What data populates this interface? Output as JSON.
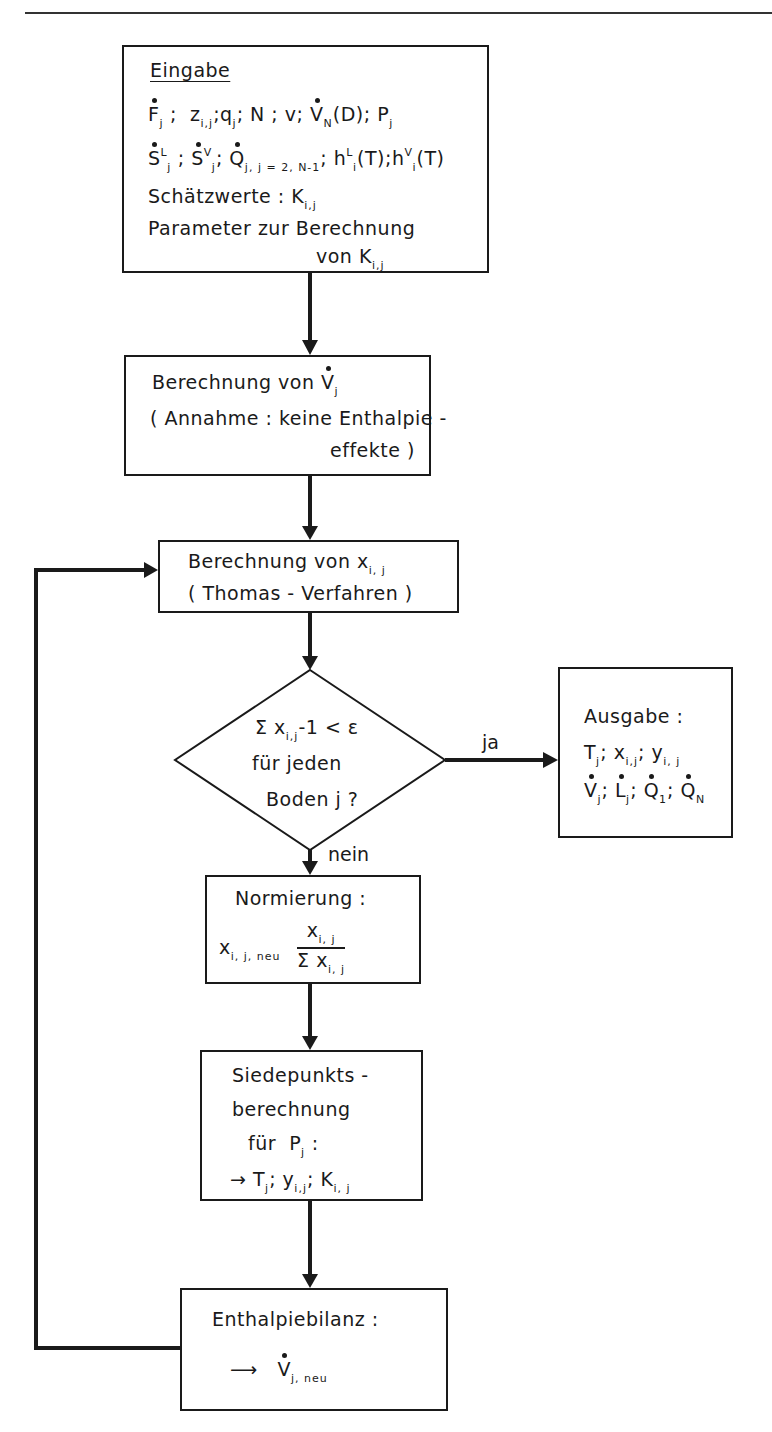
{
  "page": {
    "header_rule": true,
    "header_text": "4.5  Lösungsmethoden"
  },
  "input_box": {
    "title": "Eingabe",
    "line1": {
      "F": "F",
      "F_sub": "j",
      "z": "z",
      "z_sub": "i,j",
      "q": "q",
      "q_sub": "j",
      "N": "N",
      "v": "v",
      "V": "V",
      "V_sub": "N",
      "D": "(D)",
      "P": "P",
      "P_sub": "j"
    },
    "line2": {
      "SL": "S",
      "SL_sup": "L",
      "SL_sub": "j",
      "SV": "S",
      "SV_sup": "V",
      "SV_sub": "j",
      "Q": "Q",
      "Q_sub": "j, j = 2, N-1",
      "hL": "h",
      "hL_sup": "L",
      "hL_sub": "i",
      "hL_arg": "(T)",
      "hV": "h",
      "hV_sup": "V",
      "hV_sub": "i",
      "hV_arg": "(T)"
    },
    "line3_label": "Schätzwerte :",
    "line3_var": "K",
    "line3_sub": "i,j",
    "line4": "Parameter zur Berechnung",
    "line5_prefix": "von",
    "line5_var": "K",
    "line5_sub": "i,j"
  },
  "vapor_box": {
    "line1_prefix": "Berechnung  von",
    "line1_var": "V",
    "line1_sub": "j",
    "line2": "( Annahme : keine Enthalpie -",
    "line3": "effekte )"
  },
  "thomas_box": {
    "line1_prefix": "Berechnung  von",
    "line1_var": "x",
    "line1_sub": "i, j",
    "line2": "( Thomas - Verfahren )"
  },
  "decision": {
    "line1_sigma": "Σ x",
    "line1_sub": "i,j",
    "line1_rest": "-1 < ε",
    "line2": "für  jeden",
    "line3": "Boden j ?",
    "yes_label": "ja",
    "no_label": "nein"
  },
  "output_box": {
    "title": "Ausgabe :",
    "line1": {
      "T": "T",
      "T_sub": "j",
      "x": "x",
      "x_sub": "i,j",
      "y": "y",
      "y_sub": "i, j"
    },
    "line2": {
      "V": "V",
      "V_sub": "j",
      "L": "L",
      "L_sub": "j",
      "Q1": "Q",
      "Q1_sub": "1",
      "QN": "Q",
      "QN_sub": "N"
    }
  },
  "normalize_box": {
    "title": "Normierung :",
    "lhs": "x",
    "lhs_sub": "i, j, neu",
    "num": "x",
    "num_sub": "i, j",
    "den": "Σ x",
    "den_sub": "i, j"
  },
  "bubble_box": {
    "line1": "Siedepunkts -",
    "line2": "berechnung",
    "line3_prefix": "für",
    "line3_var": "P",
    "line3_sub": "j",
    "line3_suffix": ":",
    "line4_arrow": "→",
    "line4": {
      "T": "T",
      "T_sub": "j",
      "y": "y",
      "y_sub": "i,j",
      "K": "K",
      "K_sub": "i, j"
    }
  },
  "enthalpy_box": {
    "title": "Enthalpiebilanz :",
    "arrow": "⟶",
    "var": "V",
    "var_sub": "j, neu"
  }
}
